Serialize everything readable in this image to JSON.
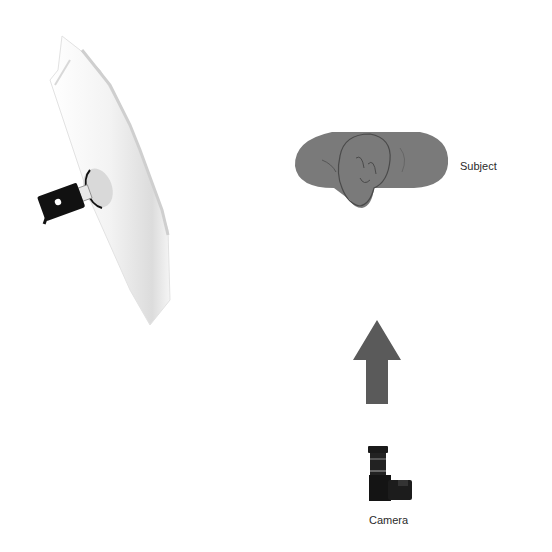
{
  "diagram": {
    "type": "lighting-setup",
    "elements": [
      {
        "id": "light",
        "label": "",
        "icon": "umbrella-softbox-light-icon"
      },
      {
        "id": "subject",
        "label": "Subject",
        "icon": "subject-head-icon"
      },
      {
        "id": "arrow",
        "label": "",
        "icon": "arrow-up-icon"
      },
      {
        "id": "camera",
        "label": "Camera",
        "icon": "camera-icon"
      }
    ],
    "colors": {
      "subject_fill": "#7a7a7a",
      "arrow_fill": "#5a5a5a",
      "light_body": "#111111",
      "diffuser": "#eeeeee"
    }
  },
  "labels": {
    "subject": "Subject",
    "camera": "Camera"
  }
}
